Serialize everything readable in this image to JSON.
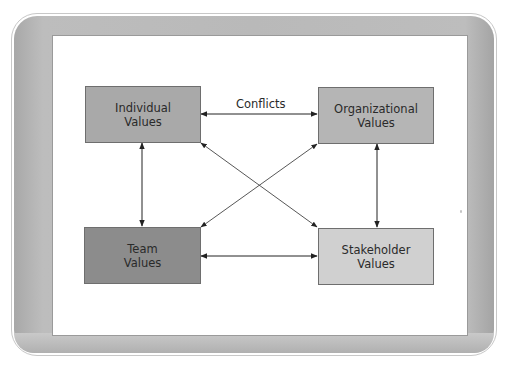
{
  "diagram": {
    "type": "relationship-diagram",
    "nodes": [
      {
        "id": "individual",
        "label": "Individual\nValues",
        "fill": "#a9a9a9"
      },
      {
        "id": "organizational",
        "label": "Organizational\nValues",
        "fill": "#b5b5b5"
      },
      {
        "id": "team",
        "label": "Team\nValues",
        "fill": "#8c8c8c"
      },
      {
        "id": "stakeholder",
        "label": "Stakeholder\nValues",
        "fill": "#d0d0d0"
      }
    ],
    "edges": [
      {
        "from": "individual",
        "to": "organizational",
        "direction": "both",
        "label": "Conflicts"
      },
      {
        "from": "individual",
        "to": "team",
        "direction": "both",
        "label": ""
      },
      {
        "from": "organizational",
        "to": "stakeholder",
        "direction": "both",
        "label": ""
      },
      {
        "from": "team",
        "to": "stakeholder",
        "direction": "both",
        "label": ""
      },
      {
        "from": "individual",
        "to": "stakeholder",
        "direction": "both",
        "label": ""
      },
      {
        "from": "organizational",
        "to": "team",
        "direction": "both",
        "label": ""
      }
    ],
    "conflicts_label": "Conflicts"
  },
  "colors": {
    "frame_band": "#b9b9b9",
    "line": "#222222",
    "node_border": "#6e6e6e"
  }
}
